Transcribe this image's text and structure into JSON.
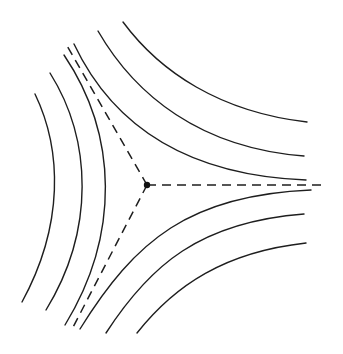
{
  "diagram": {
    "title": "",
    "colors": {
      "line": "#1e1e1e",
      "point": "#111111",
      "background": "#ffffff"
    },
    "saddle_point": {
      "x": 147,
      "y": 185,
      "radius": 3.2
    },
    "separatrices": [
      {
        "name": "separatrix-right",
        "d": "M147,185 L322,185"
      },
      {
        "name": "separatrix-upper-left",
        "d": "M147,185 L66,44"
      },
      {
        "name": "separatrix-lower-left",
        "d": "M147,185 L71,331"
      }
    ],
    "curves": [
      {
        "name": "level-curve-upper-right-outer",
        "d": "M123,22 C160,72 220,112 307,122"
      },
      {
        "name": "level-curve-upper-right-middle",
        "d": "M98,31 C135,95 200,148 304,156"
      },
      {
        "name": "level-curve-upper-right-inner",
        "d": "M74,44 C110,120 180,175 306,180"
      },
      {
        "name": "level-curve-lower-right-inner",
        "d": "M80,329 C135,240 190,195 311,190"
      },
      {
        "name": "level-curve-lower-right-middle",
        "d": "M106,333 C150,265 200,222 304,214"
      },
      {
        "name": "level-curve-lower-right-outer",
        "d": "M137,333 C175,285 225,252 306,243"
      },
      {
        "name": "level-curve-left-inner",
        "d": "M64,55 C118,135 120,235 65,325"
      },
      {
        "name": "level-curve-left-middle",
        "d": "M50,73 C92,140 95,230 46,310"
      },
      {
        "name": "level-curve-left-outer",
        "d": "M35,94 C62,150 64,225 22,302"
      }
    ]
  }
}
